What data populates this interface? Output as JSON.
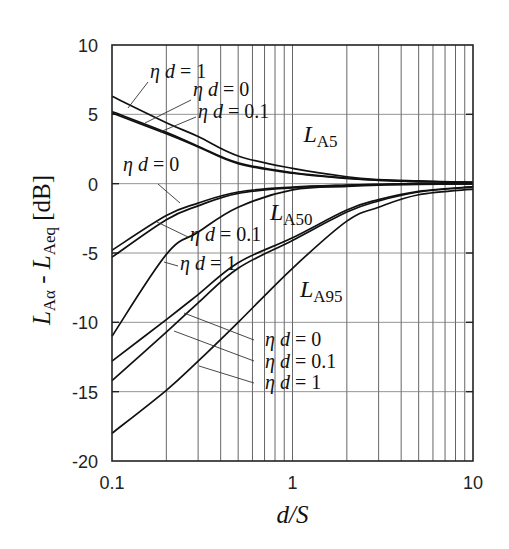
{
  "chart_data": {
    "type": "line",
    "title": "",
    "xlabel": "d/S",
    "ylabel": "L_Aα - L_Aeq [dB]",
    "ylabel_parts": {
      "main_left": "L",
      "sub_left": "Aα",
      "dash": "-",
      "main_right": "L",
      "sub_right": "Aeq",
      "unit": "[dB]"
    },
    "xscale": "log",
    "xlim": [
      0.1,
      10
    ],
    "ylim": [
      -20,
      10
    ],
    "x_ticks": [
      0.1,
      1,
      10
    ],
    "x_tick_labels": [
      "0.1",
      "1",
      "10"
    ],
    "y_ticks": [
      10,
      5,
      0,
      -5,
      -10,
      -15,
      -20
    ],
    "y_tick_labels": [
      "10",
      "5",
      "0",
      "-5",
      "-10",
      "-15",
      "-20"
    ],
    "grid": {
      "x_minor_log": true,
      "y_major": true
    },
    "legend": null,
    "x": [
      0.1,
      0.2,
      0.3,
      0.5,
      1,
      2,
      3,
      5,
      10
    ],
    "series": [
      {
        "name": "L_A5, ηd = 0",
        "group": "LA5",
        "values": [
          5.2,
          3.7,
          2.7,
          1.5,
          0.8,
          0.4,
          0.25,
          0.15,
          0.1
        ]
      },
      {
        "name": "L_A5, ηd = 0.1",
        "group": "LA5",
        "values": [
          5.1,
          3.6,
          2.65,
          1.45,
          0.75,
          0.38,
          0.24,
          0.15,
          0.1
        ]
      },
      {
        "name": "L_A5, ηd = 1",
        "group": "LA5",
        "values": [
          6.3,
          4.4,
          3.4,
          2.0,
          1.1,
          0.5,
          0.3,
          0.2,
          0.1
        ]
      },
      {
        "name": "L_A50, ηd = 0",
        "group": "LA50",
        "values": [
          -4.8,
          -2.3,
          -1.4,
          -0.6,
          -0.25,
          -0.1,
          -0.05,
          0,
          0
        ]
      },
      {
        "name": "L_A50, ηd = 0.1",
        "group": "LA50",
        "values": [
          -5.3,
          -2.6,
          -1.6,
          -0.7,
          -0.3,
          -0.12,
          -0.06,
          -0.02,
          0
        ]
      },
      {
        "name": "L_A50, ηd = 1",
        "group": "LA50",
        "values": [
          -11.0,
          -5.1,
          -3.5,
          -1.7,
          -0.45,
          -0.2,
          -0.1,
          -0.05,
          -0.02
        ]
      },
      {
        "name": "L_A95, ηd = 0",
        "group": "LA95",
        "values": [
          -12.8,
          -9.8,
          -8.0,
          -5.7,
          -3.9,
          -1.9,
          -1.15,
          -0.55,
          -0.22
        ]
      },
      {
        "name": "L_A95, ηd = 0.1",
        "group": "LA95",
        "values": [
          -14.2,
          -10.7,
          -8.6,
          -6.1,
          -4.1,
          -2.05,
          -1.25,
          -0.6,
          -0.25
        ]
      },
      {
        "name": "L_A95, ηd = 1",
        "group": "LA95",
        "values": [
          -18.0,
          -14.9,
          -12.8,
          -10.0,
          -6.1,
          -2.7,
          -1.7,
          -0.8,
          -0.4
        ]
      }
    ],
    "annotations": [
      {
        "text": "L_A5",
        "main": "L",
        "sub": "A5",
        "x": 1.15,
        "y": 3.0
      },
      {
        "text": "L_A50",
        "main": "L",
        "sub": "A50",
        "x": 0.75,
        "y": -2.6
      },
      {
        "text": "L_A95",
        "main": "L",
        "sub": "A95",
        "x": 1.1,
        "y": -8.2
      }
    ],
    "leader_labels": [
      {
        "text": "ηd = 1",
        "label_px": [
          150,
          78
        ],
        "line": [
          [
            148,
            82
          ],
          [
            128,
            108
          ]
        ]
      },
      {
        "text": "ηd = 0",
        "label_px": [
          193,
          96
        ],
        "line": [
          [
            191,
            100
          ],
          [
            145,
            123
          ]
        ]
      },
      {
        "text": "ηd = 0.1",
        "label_px": [
          198,
          118
        ],
        "line": [
          [
            196,
            117
          ],
          [
            160,
            132
          ]
        ]
      },
      {
        "text": "ηd = 0",
        "label_px": [
          123,
          171
        ],
        "line": [
          [
            158,
            184
          ],
          [
            180,
            203
          ]
        ]
      },
      {
        "text": "ηd = 0.1",
        "label_px": [
          190,
          241
        ],
        "line": [
          [
            188,
            237
          ],
          [
            157,
            222
          ]
        ]
      },
      {
        "text": "ηd = 1",
        "label_px": [
          180,
          270
        ],
        "line": [
          [
            178,
            266
          ],
          [
            164,
            262
          ]
        ]
      },
      {
        "text": "ηd = 0",
        "label_px": [
          265,
          346
        ],
        "line": [
          [
            254,
            340
          ],
          [
            184,
            313
          ]
        ]
      },
      {
        "text": "ηd = 0.1",
        "label_px": [
          265,
          368
        ],
        "line": [
          [
            254,
            361
          ],
          [
            174,
            331
          ]
        ]
      },
      {
        "text": "ηd = 1",
        "label_px": [
          265,
          389
        ],
        "line": [
          [
            254,
            383
          ],
          [
            199,
            366
          ]
        ]
      }
    ]
  }
}
